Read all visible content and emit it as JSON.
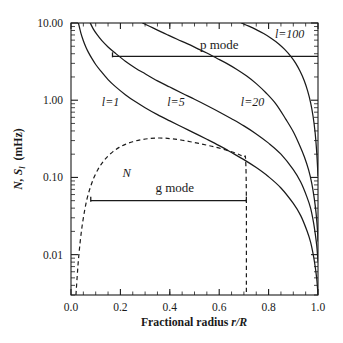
{
  "figure": {
    "title": "",
    "y_axis_label": "N,  S",
    "y_axis_label_sub": "l",
    "y_axis_label_unit": "(mHz)",
    "x_axis_label_pre": "Fractional radius ",
    "x_axis_label_italic": "r/R",
    "annotations": {
      "p_mode": "p mode",
      "g_mode": "g mode",
      "brunt_vaisala": "N",
      "l1": "l=1",
      "l5": "l=5",
      "l20": "l=20",
      "l100": "l=100"
    },
    "colors": {
      "ink": "#1a1a1a",
      "background": "#ffffff"
    }
  },
  "chart_data": {
    "type": "line",
    "xlabel": "Fractional radius r/R",
    "ylabel": "N, S_l (mHz)",
    "xlim": [
      0.0,
      1.0
    ],
    "ylim": [
      0.003,
      10.0
    ],
    "yscale": "log",
    "xscale": "linear",
    "grid": false,
    "legend": "none",
    "xticks": [
      0.0,
      0.2,
      0.4,
      0.6,
      0.8,
      1.0
    ],
    "xticklabels": [
      "0.0",
      "0.2",
      "0.4",
      "0.6",
      "0.8",
      "1.0"
    ],
    "yticks": [
      0.01,
      0.1,
      1.0,
      10.0
    ],
    "yticklabels": [
      "0.01",
      "0.10",
      "1.00",
      "10.00"
    ],
    "series": [
      {
        "name": "l=1",
        "style": "solid",
        "label_x": 0.16,
        "label_y": 0.95,
        "x": [
          0.03,
          0.04,
          0.05,
          0.06,
          0.07,
          0.085,
          0.1,
          0.12,
          0.15,
          0.18,
          0.22,
          0.26,
          0.3,
          0.35,
          0.4,
          0.45,
          0.5,
          0.55,
          0.6,
          0.65,
          0.7,
          0.75,
          0.8,
          0.85,
          0.9,
          0.93,
          0.955,
          0.97,
          0.982,
          0.99,
          0.995,
          0.998,
          1.0
        ],
        "y": [
          10.0,
          7.4,
          5.9,
          4.9,
          4.2,
          3.45,
          2.9,
          2.4,
          1.85,
          1.5,
          1.18,
          0.96,
          0.8,
          0.65,
          0.54,
          0.45,
          0.375,
          0.312,
          0.258,
          0.21,
          0.17,
          0.134,
          0.102,
          0.073,
          0.046,
          0.032,
          0.0205,
          0.0145,
          0.0095,
          0.0065,
          0.0048,
          0.0037,
          0.003
        ]
      },
      {
        "name": "l=5",
        "style": "solid",
        "label_x": 0.425,
        "label_y": 0.95,
        "x": [
          0.078,
          0.09,
          0.105,
          0.125,
          0.15,
          0.18,
          0.22,
          0.26,
          0.3,
          0.35,
          0.4,
          0.45,
          0.5,
          0.55,
          0.6,
          0.65,
          0.7,
          0.75,
          0.8,
          0.85,
          0.9,
          0.93,
          0.955,
          0.97,
          0.982,
          0.99,
          0.995,
          0.998,
          1.0
        ],
        "y": [
          10.0,
          8.4,
          7.1,
          5.9,
          4.9,
          4.05,
          3.2,
          2.62,
          2.2,
          1.78,
          1.48,
          1.23,
          1.03,
          0.855,
          0.705,
          0.575,
          0.465,
          0.366,
          0.278,
          0.2,
          0.126,
          0.087,
          0.056,
          0.04,
          0.026,
          0.0175,
          0.013,
          0.01,
          0.0082
        ]
      },
      {
        "name": "l=20",
        "style": "solid",
        "label_x": 0.735,
        "label_y": 0.95,
        "x": [
          0.29,
          0.32,
          0.35,
          0.39,
          0.43,
          0.47,
          0.51,
          0.55,
          0.59,
          0.63,
          0.67,
          0.71,
          0.75,
          0.79,
          0.83,
          0.87,
          0.9,
          0.925,
          0.945,
          0.962,
          0.975,
          0.985,
          0.992,
          0.996,
          0.999,
          1.0
        ],
        "y": [
          10.0,
          9.0,
          8.1,
          7.05,
          6.15,
          5.4,
          4.7,
          4.08,
          3.5,
          3.0,
          2.52,
          2.07,
          1.64,
          1.24,
          0.89,
          0.565,
          0.39,
          0.263,
          0.184,
          0.125,
          0.083,
          0.053,
          0.035,
          0.025,
          0.018,
          0.015
        ]
      },
      {
        "name": "l=100",
        "style": "solid",
        "label_x": 0.885,
        "label_y": 7.3,
        "x": [
          0.69,
          0.72,
          0.75,
          0.78,
          0.81,
          0.84,
          0.865,
          0.89,
          0.91,
          0.928,
          0.944,
          0.958,
          0.97,
          0.98,
          0.988,
          0.994,
          0.998,
          1.0
        ],
        "y": [
          10.0,
          9.1,
          8.2,
          7.3,
          6.35,
          5.4,
          4.55,
          3.7,
          3.0,
          2.35,
          1.8,
          1.32,
          0.93,
          0.62,
          0.39,
          0.23,
          0.14,
          0.105
        ]
      },
      {
        "name": "N",
        "style": "dashed",
        "label_x": 0.225,
        "label_y": 0.115,
        "x": [
          0.02,
          0.025,
          0.03,
          0.037,
          0.045,
          0.055,
          0.065,
          0.078,
          0.092,
          0.108,
          0.125,
          0.145,
          0.17,
          0.195,
          0.22,
          0.25,
          0.28,
          0.31,
          0.34,
          0.375,
          0.41,
          0.45,
          0.49,
          0.53,
          0.57,
          0.61,
          0.65,
          0.68,
          0.7,
          0.707,
          0.71,
          0.71
        ],
        "y": [
          0.003,
          0.0052,
          0.0085,
          0.0145,
          0.0235,
          0.037,
          0.053,
          0.074,
          0.098,
          0.125,
          0.152,
          0.182,
          0.216,
          0.245,
          0.268,
          0.29,
          0.306,
          0.317,
          0.323,
          0.323,
          0.316,
          0.303,
          0.287,
          0.27,
          0.253,
          0.235,
          0.215,
          0.198,
          0.184,
          0.17,
          0.05,
          0.003
        ]
      }
    ],
    "annotations": [
      {
        "name": "p_mode_line",
        "text": "p mode",
        "type": "hline",
        "y": 3.7,
        "x_start": 0.168,
        "x_end": 1.0,
        "text_x": 0.6,
        "text_y": 5.2
      },
      {
        "name": "g_mode_line",
        "text": "g mode",
        "type": "hline",
        "y": 0.05,
        "x_start": 0.08,
        "x_end": 0.71,
        "text_x": 0.42,
        "text_y": 0.072
      }
    ]
  }
}
